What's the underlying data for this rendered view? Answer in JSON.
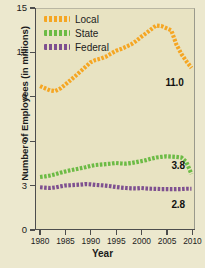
{
  "chart_data": {
    "type": "line",
    "title": "",
    "xlabel": "Year",
    "ylabel": "Number of Employees (in millions)",
    "xlim": [
      1979,
      2010.5
    ],
    "ylim": [
      0,
      15
    ],
    "grid": false,
    "legend_position": "top-left",
    "xticks": [
      "1980",
      "1985",
      "1990",
      "1995",
      "2000",
      "2005",
      "2010"
    ],
    "xtick_values": [
      1980,
      1985,
      1990,
      1995,
      2000,
      2005,
      2010
    ],
    "yticks": [
      "0",
      "3",
      "6",
      "9",
      "12",
      "15"
    ],
    "ytick_values": [
      0,
      3,
      6,
      9,
      12,
      15
    ],
    "x": [
      1980,
      1981,
      1982,
      1983,
      1984,
      1985,
      1986,
      1987,
      1988,
      1989,
      1990,
      1991,
      1992,
      1993,
      1994,
      1995,
      1996,
      1997,
      1998,
      1999,
      2000,
      2001,
      2002,
      2003,
      2004,
      2005,
      2006,
      2007,
      2008,
      2009,
      2010
    ],
    "series": [
      {
        "name": "Local",
        "color": "#f5a623",
        "style": "dotted",
        "end_label": "11.0",
        "values": [
          9.77,
          9.62,
          9.47,
          9.43,
          9.6,
          9.87,
          10.16,
          10.45,
          10.76,
          11.07,
          11.38,
          11.54,
          11.63,
          11.76,
          11.96,
          12.16,
          12.28,
          12.43,
          12.59,
          12.82,
          13.1,
          13.35,
          13.62,
          13.88,
          13.85,
          13.7,
          13.55,
          12.6,
          11.95,
          11.45,
          11.0
        ]
      },
      {
        "name": "State",
        "color": "#6cbb45",
        "style": "dotted",
        "end_label": "3.8",
        "values": [
          3.6,
          3.64,
          3.7,
          3.78,
          3.88,
          3.97,
          4.05,
          4.12,
          4.19,
          4.26,
          4.35,
          4.41,
          4.44,
          4.47,
          4.5,
          4.55,
          4.52,
          4.5,
          4.54,
          4.6,
          4.67,
          4.74,
          4.84,
          4.92,
          4.96,
          5.0,
          4.98,
          4.96,
          4.92,
          4.6,
          3.8
        ]
      },
      {
        "name": "Federal",
        "color": "#7e5090",
        "style": "dotted",
        "end_label": "2.8",
        "values": [
          2.9,
          2.87,
          2.85,
          2.89,
          2.96,
          3.02,
          3.04,
          3.06,
          3.08,
          3.12,
          3.1,
          3.06,
          3.04,
          3.01,
          2.97,
          2.92,
          2.88,
          2.85,
          2.83,
          2.82,
          2.85,
          2.82,
          2.8,
          2.79,
          2.78,
          2.78,
          2.77,
          2.77,
          2.78,
          2.8,
          2.8
        ]
      }
    ]
  }
}
